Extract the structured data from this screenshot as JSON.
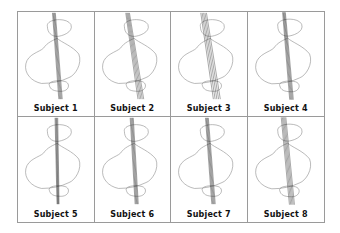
{
  "figure": {
    "layout": {
      "columns": 4,
      "rows": 2
    },
    "stroke_colors": {
      "outline": "#8a8a8a",
      "axis_lines": "#222222"
    },
    "panels": [
      {
        "label": "Subject 1",
        "tilt": 0.08,
        "spread": 2
      },
      {
        "label": "Subject 2",
        "tilt": 0.16,
        "spread": 3
      },
      {
        "label": "Subject 3",
        "tilt": 0.16,
        "spread": 4
      },
      {
        "label": "Subject 4",
        "tilt": 0.09,
        "spread": 2
      },
      {
        "label": "Subject 5",
        "tilt": 0.02,
        "spread": 1.5
      },
      {
        "label": "Subject 6",
        "tilt": 0.06,
        "spread": 2
      },
      {
        "label": "Subject 7",
        "tilt": 0.08,
        "spread": 2
      },
      {
        "label": "Subject 8",
        "tilt": 0.1,
        "spread": 3
      }
    ]
  }
}
